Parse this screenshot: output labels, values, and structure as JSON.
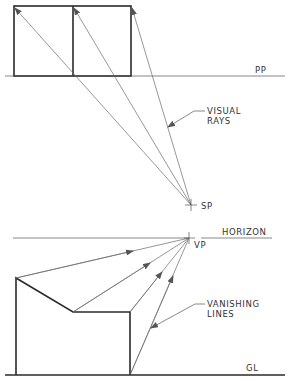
{
  "diagram": {
    "labels": {
      "picture_plane": "PP",
      "visual_rays_line1": "VISUAL",
      "visual_rays_line2": "RAYS",
      "station_point": "SP",
      "horizon": "HORIZON",
      "vanishing_point": "VP",
      "vanishing_lines_line1": "VANISHING",
      "vanishing_lines_line2": "LINES",
      "ground_line": "GL"
    },
    "colors": {
      "object_line": "#2a2a2a",
      "construction_line": "#6a6a6a",
      "text": "#333333",
      "background": "#ffffff"
    },
    "plan_view": {
      "rectangle_corners_x": [
        14,
        73,
        131
      ],
      "rectangle_top_y": 6,
      "picture_plane_y": 76,
      "station_point": [
        191,
        205
      ]
    },
    "perspective_view": {
      "horizon_y": 238,
      "vanishing_point": [
        189,
        238
      ],
      "ground_line_y": 375,
      "outline_points": [
        [
          16,
          375
        ],
        [
          16,
          278
        ],
        [
          73,
          312
        ],
        [
          130,
          312
        ],
        [
          130,
          375
        ]
      ]
    }
  }
}
